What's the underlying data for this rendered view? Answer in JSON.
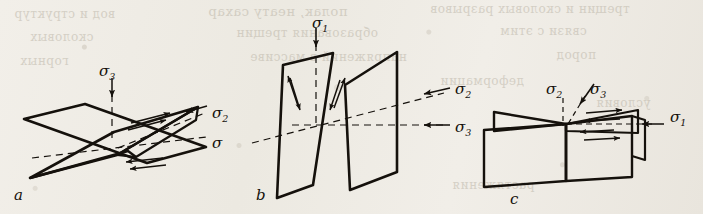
{
  "figure": {
    "background_color": "#efece6",
    "ink_color": "#15110c",
    "panel_count": 3
  },
  "bleed_through": {
    "description": "faint mirrored text showing through from the reverse side of the page",
    "lines": [
      {
        "text": "полак, неату сахар",
        "x": 208,
        "y": 4,
        "size": 13
      },
      {
        "text": "трещин и сколовых разрывов",
        "x": 430,
        "y": 2,
        "size": 12
      },
      {
        "text": "вод и структур",
        "x": 14,
        "y": 7,
        "size": 12
      },
      {
        "text": "образования трещин",
        "x": 236,
        "y": 26,
        "size": 12
      },
      {
        "text": "связи с этим",
        "x": 500,
        "y": 24,
        "size": 12
      },
      {
        "text": "сколовых",
        "x": 30,
        "y": 30,
        "size": 12
      },
      {
        "text": "напряжений в массиве",
        "x": 250,
        "y": 50,
        "size": 12
      },
      {
        "text": "пород",
        "x": 556,
        "y": 48,
        "size": 12
      },
      {
        "text": "горных",
        "x": 20,
        "y": 54,
        "size": 12
      },
      {
        "text": "деформации",
        "x": 440,
        "y": 74,
        "size": 12
      },
      {
        "text": "условия",
        "x": 596,
        "y": 96,
        "size": 12
      },
      {
        "text": "растяжения",
        "x": 452,
        "y": 178,
        "size": 12
      }
    ]
  },
  "panels": [
    {
      "id": "a",
      "letter": "a",
      "letter_x": 14,
      "letter_y": 186,
      "description": "Two conjugate shear planes intersecting at a shallow angle; maximum compression applied vertically from above",
      "stress_labels": [
        {
          "name": "sigma-3",
          "symbol": "σ",
          "subscript": "3",
          "x": 99,
          "y": 62,
          "arrow_direction": "down",
          "line_style": "dashed",
          "meaning": "minimum principal stress, vertical"
        },
        {
          "name": "sigma-2",
          "symbol": "σ",
          "subscript": "2",
          "x": 212,
          "y": 104,
          "arrow_direction": "left",
          "line_style": "dashed",
          "meaning": "intermediate principal stress, inclined"
        },
        {
          "name": "sigma-1",
          "symbol": "σ",
          "subscript": "",
          "x": 212,
          "y": 134,
          "arrow_direction": "left",
          "line_style": "dashed",
          "meaning": "maximum principal stress, horizontal"
        }
      ]
    },
    {
      "id": "b",
      "letter": "b",
      "letter_x": 256,
      "letter_y": 186,
      "description": "Two steeply dipping conjugate planes forming an X; maximum compression vertical with shear couples marked on the upper wedges",
      "stress_labels": [
        {
          "name": "sigma-1",
          "symbol": "σ",
          "subscript": "1",
          "x": 312,
          "y": 14,
          "arrow_direction": "down",
          "line_style": "dashed",
          "meaning": "maximum principal stress, vertical"
        },
        {
          "name": "sigma-2",
          "symbol": "σ",
          "subscript": "2",
          "x": 455,
          "y": 80,
          "arrow_direction": "left",
          "line_style": "dashed",
          "meaning": "intermediate principal stress, inclined"
        },
        {
          "name": "sigma-3",
          "symbol": "σ",
          "subscript": "3",
          "x": 455,
          "y": 118,
          "arrow_direction": "left",
          "line_style": "dashed",
          "meaning": "minimum principal stress, horizontal"
        }
      ]
    },
    {
      "id": "c",
      "letter": "c",
      "letter_x": 510,
      "letter_y": 190,
      "description": "Hinged vertical planes viewed nearly edge-on; compression applied horizontally from the right with multiple shear arrows along the intersection",
      "stress_labels": [
        {
          "name": "sigma-2",
          "symbol": "σ",
          "subscript": "2",
          "x": 546,
          "y": 80,
          "arrow_direction": "down",
          "line_style": "dashed",
          "meaning": "intermediate principal stress, vertical"
        },
        {
          "name": "sigma-3",
          "symbol": "σ",
          "subscript": "3",
          "x": 590,
          "y": 80,
          "arrow_direction": "down-left",
          "line_style": "dashed",
          "meaning": "minimum principal stress, inclined"
        },
        {
          "name": "sigma-1",
          "symbol": "σ",
          "subscript": "1",
          "x": 670,
          "y": 108,
          "arrow_direction": "left",
          "line_style": "solid",
          "meaning": "maximum principal stress, horizontal"
        }
      ]
    }
  ]
}
